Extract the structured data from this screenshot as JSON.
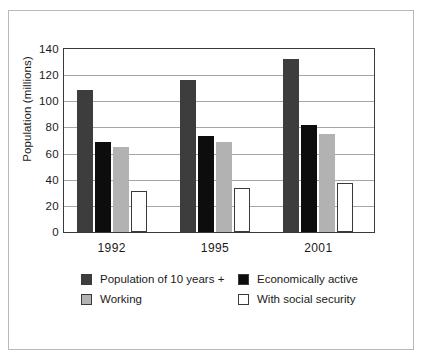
{
  "chart_data": {
    "type": "bar",
    "title": "",
    "subtitle": "",
    "xlabel": "",
    "ylabel": "Population (millions)",
    "categories": [
      "1992",
      "1995",
      "2001"
    ],
    "ylim": [
      0,
      140
    ],
    "yticks": [
      0,
      20,
      40,
      60,
      80,
      100,
      120,
      140
    ],
    "ytick_labels": [
      "0",
      "20",
      "40",
      "60",
      "80",
      "100",
      "120",
      "140"
    ],
    "grid": true,
    "legend_position": "bottom",
    "series": [
      {
        "name": "Population of 10 years +",
        "color": "#3d3d3d",
        "values": [
          109,
          116,
          132
        ]
      },
      {
        "name": "Economically active",
        "color": "#0d0d0d",
        "values": [
          69,
          73.5,
          82
        ]
      },
      {
        "name": "Working",
        "color": "#b2b2b2",
        "values": [
          65,
          69,
          75
        ]
      },
      {
        "name": "With social security",
        "color": "#ffffff",
        "values": [
          31.5,
          34,
          37.5
        ]
      }
    ]
  },
  "figure": {
    "border_color": "#b9b9b9",
    "background": "#ffffff",
    "axis_color": "#3a3a3a",
    "gridline_color": "#a6a6a6"
  }
}
